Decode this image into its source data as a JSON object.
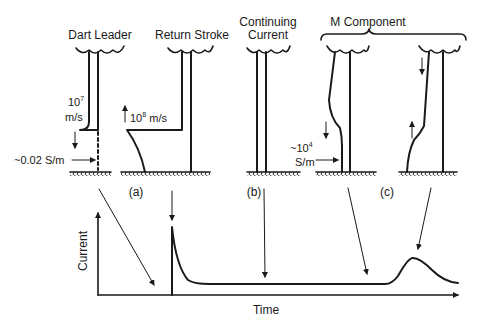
{
  "figure": {
    "panels": [
      {
        "id": "dart-leader",
        "title": "Dart Leader",
        "speed_label": "10",
        "speed_exp": "7",
        "speed_unit": "m/s",
        "conductivity_label": "~0.02 S/m"
      },
      {
        "id": "return-stroke",
        "title": "Return Stroke",
        "speed_label": "10",
        "speed_exp": "8",
        "speed_unit": "m/s"
      },
      {
        "id": "continuing-current",
        "title_line1": "Continuing",
        "title_line2": "Current"
      },
      {
        "id": "m-component",
        "title": "M Component",
        "conductivity_prefix": "~10",
        "conductivity_exp": "4",
        "conductivity_unit": "S/m"
      }
    ],
    "subfigure_labels": [
      "(a)",
      "(b)",
      "(c)"
    ],
    "plot": {
      "ylabel": "Current",
      "xlabel": "Time"
    }
  }
}
